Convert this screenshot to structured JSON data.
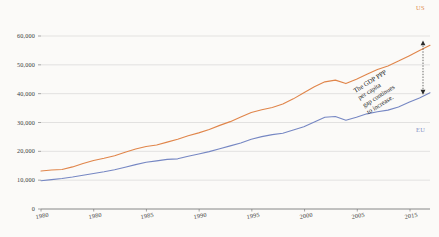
{
  "chart_data": {
    "type": "line",
    "title": "",
    "subtitle": "",
    "xlabel": "",
    "ylabel": "",
    "xlim": [
      1980,
      2017
    ],
    "ylim": [
      0,
      60000
    ],
    "grid": true,
    "grid_axis": "y",
    "legend_position": "line-end-labels",
    "y_ticks": [
      0,
      10000,
      20000,
      30000,
      40000,
      50000,
      60000
    ],
    "y_tick_labels": [
      "0",
      "10,000",
      "20,000",
      "30,000",
      "40,000",
      "50,000",
      "60,000"
    ],
    "x_ticks": [
      1980,
      1980,
      1985,
      1990,
      1995,
      2000,
      2005,
      2015
    ],
    "x_tick_labels": [
      "1980",
      "1980",
      "1985",
      "1990",
      "1995",
      "2000",
      "2005",
      "2015"
    ],
    "x": [
      1980,
      1981,
      1982,
      1983,
      1984,
      1985,
      1986,
      1987,
      1988,
      1989,
      1990,
      1991,
      1992,
      1993,
      1994,
      1995,
      1996,
      1997,
      1998,
      1999,
      2000,
      2001,
      2002,
      2003,
      2004,
      2005,
      2006,
      2007,
      2008,
      2009,
      2010,
      2011,
      2012,
      2013,
      2014,
      2015,
      2016,
      2017
    ],
    "series": [
      {
        "name": "US",
        "color": "#e0854a",
        "values": [
          13200,
          13500,
          13700,
          14600,
          15800,
          16800,
          17600,
          18500,
          19700,
          20800,
          21700,
          22200,
          23200,
          24200,
          25400,
          26400,
          27600,
          29000,
          30300,
          31900,
          33500,
          34400,
          35200,
          36400,
          38200,
          40300,
          42400,
          44100,
          44700,
          43500,
          45000,
          46700,
          48400,
          49600,
          51300,
          53100,
          55000,
          56800
        ]
      },
      {
        "name": "EU",
        "color": "#7687c3",
        "values": [
          9800,
          10200,
          10600,
          11100,
          11700,
          12300,
          12900,
          13600,
          14500,
          15400,
          16200,
          16700,
          17200,
          17400,
          18300,
          19100,
          19900,
          20900,
          21900,
          22900,
          24200,
          25100,
          25800,
          26300,
          27400,
          28500,
          30200,
          31800,
          32100,
          30800,
          31800,
          33000,
          33700,
          34300,
          35400,
          37000,
          38500,
          40300
        ]
      }
    ],
    "annotations": [
      {
        "name": "gap-annotation",
        "text_lines": [
          "The GDP PPP",
          "per capita",
          "gap continues",
          "to increase."
        ],
        "rotation_deg": -32
      },
      {
        "name": "gap-arrow",
        "style": "dotted-double-arrow",
        "from_value": 57600,
        "to_value": 40500
      }
    ]
  },
  "labels": {
    "us": "US",
    "eu": "EU"
  },
  "annotation": {
    "line1": "The GDP PPP",
    "line2": "per capita",
    "line3": "gap continues",
    "line4": "to increase."
  }
}
